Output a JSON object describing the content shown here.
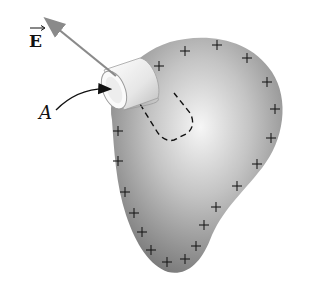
{
  "figure": {
    "field_label": "E",
    "area_label": "A",
    "colors": {
      "arrow": "#8a8a8a",
      "blob_light": "#f4f4f4",
      "blob_dark": "#7c7c7c",
      "plus": "#1a1a1a"
    },
    "plus_signs": [
      [
        159,
        66
      ],
      [
        185,
        51
      ],
      [
        217,
        45
      ],
      [
        247,
        58
      ],
      [
        267,
        82
      ],
      [
        275,
        109
      ],
      [
        271,
        138
      ],
      [
        257,
        164
      ],
      [
        237,
        186
      ],
      [
        216,
        207
      ],
      [
        204,
        225
      ],
      [
        196,
        246
      ],
      [
        185,
        259
      ],
      [
        167,
        262
      ],
      [
        151,
        250
      ],
      [
        142,
        232
      ],
      [
        134,
        213
      ],
      [
        125,
        192
      ],
      [
        118,
        161
      ],
      [
        118,
        131
      ]
    ]
  }
}
